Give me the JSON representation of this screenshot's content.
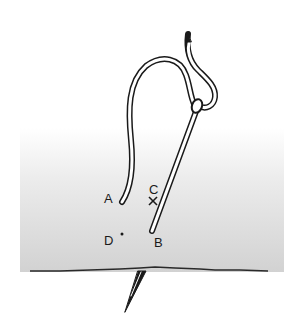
{
  "diagram": {
    "labels": {
      "A": "A",
      "B": "B",
      "C": "C",
      "D": "D"
    },
    "markers": {
      "C": "cross",
      "D": "dot"
    },
    "colors": {
      "line": "#1a1a1a",
      "fabric_light": "#ffffff",
      "fabric_dark": "#d4d4d4",
      "background": "#ffffff"
    }
  }
}
